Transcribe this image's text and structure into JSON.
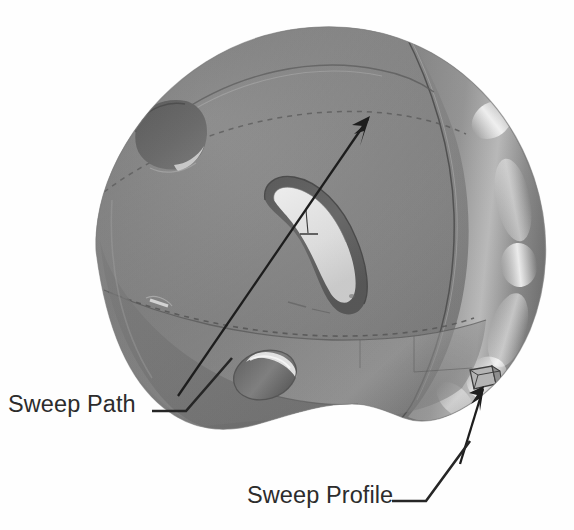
{
  "figure": {
    "kind": "cad-technical-illustration",
    "background_color": "#fefefe",
    "canvas": {
      "width": 574,
      "height": 530
    }
  },
  "callouts": [
    {
      "id": "sweep-path",
      "label": "Sweep Path",
      "text_x": 8,
      "text_y": 412,
      "text_color": "#2c2c2c",
      "leader_path": "M 152 411 L 186 411 L 232 358",
      "target_description": "long arrow running diagonally across the helmet shell"
    },
    {
      "id": "sweep-profile",
      "label": "Sweep Profile",
      "text_x": 247,
      "text_y": 503,
      "text_color": "#2c2c2c",
      "leader_path": "M 392 501 L 426 501 L 470 441",
      "target_description": "small rectangular section at the lower rim edge"
    }
  ],
  "annotation_arrows": [
    {
      "id": "sweep-path-arrow",
      "from_x": 178,
      "from_y": 396,
      "to_x": 370,
      "to_y": 116,
      "color": "#1d1d1d",
      "description": "long sweep path direction arrow across helmet"
    },
    {
      "id": "sweep-profile-arrow",
      "from_x": 462,
      "from_y": 462,
      "to_x": 484,
      "to_y": 387,
      "color": "#1d1d1d",
      "description": "short arrow to the swept profile cross-section"
    }
  ],
  "model": {
    "name": "helmet-shell",
    "surface_color_mid": "#919191",
    "surface_color_dark": "#6b6b6b",
    "surface_color_light": "#b4b4b4",
    "highlight_color": "#e6e6e6",
    "edge_color": "#4b4b4b",
    "features": [
      {
        "id": "top-vent-hexagonal",
        "label": "hexagonal recessed vent",
        "cx": 168,
        "cy": 132
      },
      {
        "id": "center-curved-slot",
        "label": "curved sweep slot",
        "cx": 300,
        "cy": 230
      },
      {
        "id": "lower-circular-hole",
        "label": "circular vent hole",
        "cx": 266,
        "cy": 374
      },
      {
        "id": "side-seam-curve",
        "label": "parting seam curve"
      },
      {
        "id": "dashed-band",
        "label": "hidden dashed contour band"
      },
      {
        "id": "bottom-rim",
        "label": "lower rim band"
      },
      {
        "id": "profile-section",
        "label": "swept profile cross-section",
        "cx": 486,
        "cy": 387
      }
    ]
  }
}
